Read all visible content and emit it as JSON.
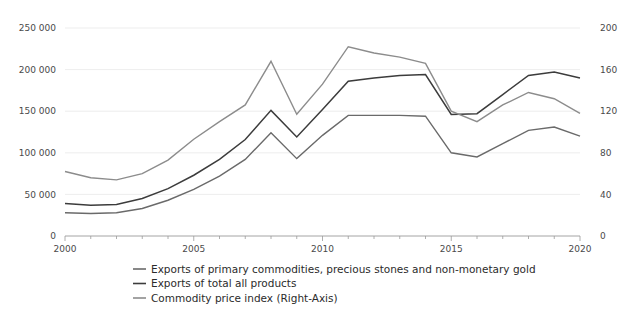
{
  "chart_data": {
    "type": "line",
    "title": "",
    "subtitle": "",
    "xlabel": "",
    "ylabel": "",
    "y2label": "",
    "grid": true,
    "legend_position": "bottom",
    "x": [
      2000,
      2001,
      2002,
      2003,
      2004,
      2005,
      2006,
      2007,
      2008,
      2009,
      2010,
      2011,
      2012,
      2013,
      2014,
      2015,
      2016,
      2017,
      2018,
      2019,
      2020
    ],
    "xlim": [
      2000,
      2020
    ],
    "xticks": [
      2000,
      2005,
      2010,
      2015,
      2020
    ],
    "xtick_labels": [
      "2000",
      "2005",
      "2010",
      "2015",
      "2020"
    ],
    "ylim": [
      0,
      250000
    ],
    "yticks": [
      0,
      50000,
      100000,
      150000,
      200000,
      250000
    ],
    "ytick_labels": [
      "0",
      "50 000",
      "100 000",
      "150 000",
      "200 000",
      "250 000"
    ],
    "y2lim": [
      0,
      200
    ],
    "y2ticks": [
      0,
      40,
      80,
      120,
      160,
      200
    ],
    "y2tick_labels": [
      "0",
      "40",
      "80",
      "120",
      "160",
      "200"
    ],
    "series": [
      {
        "name": "Exports of total all products",
        "axis": "left",
        "color": "#3c3c3c",
        "width": 1.5,
        "values": [
          39000,
          37000,
          38000,
          45000,
          57000,
          73000,
          92000,
          116000,
          151000,
          119000,
          152000,
          186000,
          190000,
          193000,
          194000,
          146000,
          147000,
          170000,
          193000,
          197000,
          190000
        ]
      },
      {
        "name": "Exports of primary commodities, precious stones and non-monetary gold",
        "axis": "left",
        "color": "#6a6a6a",
        "width": 1.4,
        "values": [
          28000,
          27000,
          28000,
          33000,
          43000,
          56000,
          72000,
          92000,
          124000,
          93000,
          121000,
          145000,
          145000,
          145000,
          144000,
          100000,
          95000,
          111000,
          127000,
          131000,
          120000
        ]
      },
      {
        "name": "Commodity price index (Right-Axis)",
        "axis": "right",
        "color": "#8c8c8c",
        "width": 1.4,
        "values": [
          62,
          56,
          54,
          60,
          73,
          93,
          110,
          126,
          168,
          117,
          146,
          182,
          176,
          172,
          166,
          120,
          110,
          126,
          138,
          132,
          118
        ]
      }
    ],
    "legend": [
      {
        "label": "Exports of primary commodities, precious stones and non-monetary gold",
        "color": "#6a6a6a"
      },
      {
        "label": "Exports of total all products",
        "color": "#3c3c3c"
      },
      {
        "label": "Commodity price index (Right-Axis)",
        "color": "#8c8c8c"
      }
    ]
  },
  "axes": {
    "left_axis_name": "left-value-axis",
    "right_axis_name": "right-index-axis",
    "bottom_axis_name": "year-axis"
  }
}
